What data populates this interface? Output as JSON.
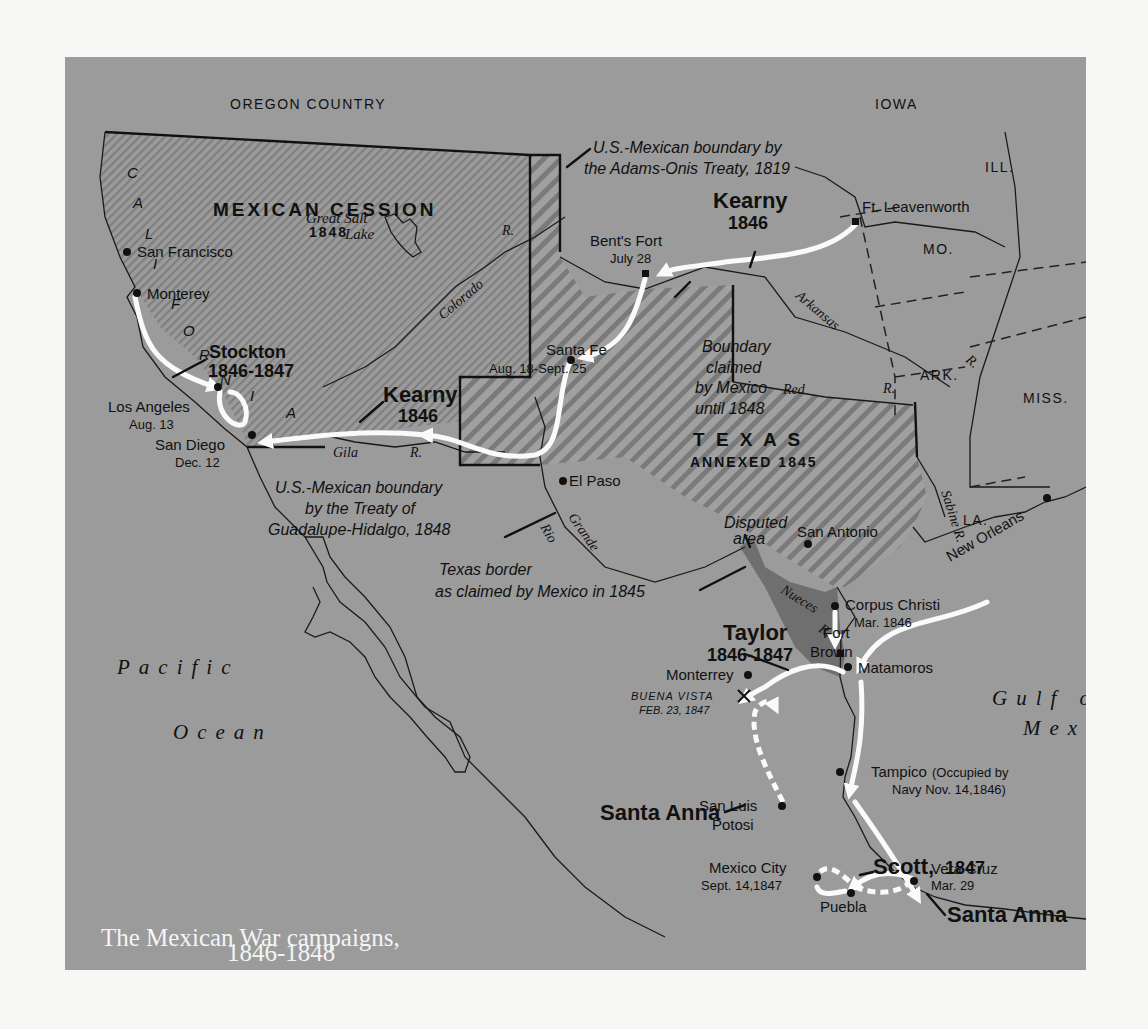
{
  "title": {
    "line1": "The Mexican War campaigns,",
    "line2": "1846-1848"
  },
  "colors": {
    "land": "#9b9b9b",
    "hatch_dark": "#7d7d7d",
    "disputed": "#6f6f6f",
    "route": "#fafafa",
    "ink": "#111111",
    "page": "#f7f7f5"
  },
  "regions": {
    "oregon": "OREGON COUNTRY",
    "iowa": "IOWA",
    "illinois": "ILL.",
    "missouri": "MO.",
    "arkansas_state": "ARK.",
    "mississippi": "MISS.",
    "louisiana": "LA.",
    "mexican_cession": "MEXICAN CESSION",
    "mexican_cession_year": "1848",
    "texas": "T E X A S",
    "texas_annexed": "ANNEXED 1845",
    "california_letters": [
      "C",
      "A",
      "L",
      "I",
      "F",
      "O",
      "R",
      "N",
      "I",
      "A"
    ]
  },
  "water": {
    "great_salt_lake_1": "Great Salt",
    "great_salt_lake_2": "Lake",
    "pacific_1": "Pacific",
    "pacific_2": "Ocean",
    "gulf_1": "Gulf of",
    "gulf_2": "Mexico"
  },
  "rivers": {
    "colorado": "Colorado",
    "colorado_r": "R.",
    "arkansas": "Arkansas",
    "arkansas_r": "R.",
    "red": "Red",
    "red_r": "R.",
    "gila": "Gila",
    "gila_r": "R.",
    "rio": "Rio",
    "grande": "Grande",
    "nueces": "Nueces",
    "nueces_r": "R.",
    "sabine": "Sabine R."
  },
  "places": [
    {
      "name": "San Francisco"
    },
    {
      "name": "Monterey"
    },
    {
      "name": "Los Angeles",
      "date": "Aug. 13"
    },
    {
      "name": "San Diego",
      "date": "Dec. 12"
    },
    {
      "name": "Bent's Fort",
      "date": "July 28"
    },
    {
      "name": "Ft. Leavenworth"
    },
    {
      "name": "Santa Fe",
      "date": "Aug. 18-Sept. 25"
    },
    {
      "name": "El Paso"
    },
    {
      "name": "San Antonio"
    },
    {
      "name": "New Orleans"
    },
    {
      "name": "Corpus Christi",
      "date": "Mar. 1846"
    },
    {
      "name": "Fort",
      "date": "Brown"
    },
    {
      "name": "Matamoros"
    },
    {
      "name": "Monterrey"
    },
    {
      "name": "Tampico",
      "date": "(Occupied by",
      "date2": "Navy Nov. 14,1846)"
    },
    {
      "name": "San Luis",
      "date": "Potosi"
    },
    {
      "name": "Vera Cruz",
      "date": "Mar. 29"
    },
    {
      "name": "Mexico City",
      "date": "Sept. 14,1847"
    },
    {
      "name": "Puebla"
    }
  ],
  "battle": {
    "name": "BUENA VISTA",
    "date": "FEB. 23, 1847",
    "icon": "crossed-swords-icon"
  },
  "commanders": {
    "kearny_north": {
      "name": "Kearny",
      "year": "1846"
    },
    "kearny_south": {
      "name": "Kearny",
      "year": "1846"
    },
    "stockton": {
      "name": "Stockton",
      "year": "1846-1847"
    },
    "taylor": {
      "name": "Taylor",
      "year": "1846-1847"
    },
    "santa_anna_north": {
      "name": "Santa Anna"
    },
    "scott": {
      "name": "Scott,",
      "year": "1847"
    },
    "santa_anna_south": {
      "name": "Santa Anna"
    }
  },
  "annotations": {
    "adams_onis_1": "U.S.-Mexican boundary by",
    "adams_onis_2": "the Adams-Onis Treaty, 1819",
    "boundary_claimed_1": "Boundary",
    "boundary_claimed_2": "claimed",
    "boundary_claimed_3": "by Mexico",
    "boundary_claimed_4": "until 1848",
    "guadalupe_1": "U.S.-Mexican boundary",
    "guadalupe_2": "by the Treaty of",
    "guadalupe_3": "Guadalupe-Hidalgo, 1848",
    "disputed_1": "Disputed",
    "disputed_2": "area",
    "texas_border_1": "Texas border",
    "texas_border_2": "as claimed by Mexico in 1845"
  }
}
